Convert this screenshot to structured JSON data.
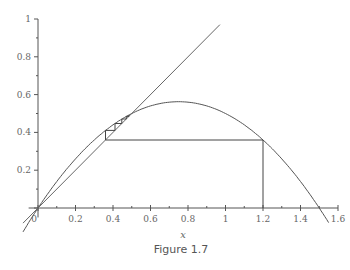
{
  "chart_data": {
    "type": "line",
    "title": "",
    "caption": "Figure 1.7",
    "xlabel": "x",
    "ylabel": "",
    "xlim": [
      0,
      1.6
    ],
    "ylim": [
      0,
      1
    ],
    "x_ticks": [
      0,
      0.2,
      0.4,
      0.6,
      0.8,
      1,
      1.2,
      1.4,
      1.6
    ],
    "x_tick_labels": [
      "0",
      "0.2",
      "0.4",
      "0.6",
      "0.8",
      "1",
      "1.2",
      "1.4",
      "1.6"
    ],
    "y_ticks": [
      0.2,
      0.4,
      0.6,
      0.8,
      1
    ],
    "y_tick_labels": [
      "0.2",
      "0.4",
      "0.6",
      "0.8",
      "1"
    ],
    "grid": false,
    "legend": null,
    "series": [
      {
        "name": "f(x) = 1.5x - x^2",
        "kind": "curve",
        "x": [
          -0.08,
          0,
          0.1,
          0.2,
          0.3,
          0.4,
          0.5,
          0.6,
          0.7,
          0.75,
          0.8,
          0.9,
          1.0,
          1.1,
          1.2,
          1.3,
          1.4,
          1.5,
          1.56
        ],
        "y": [
          -0.1264,
          0,
          0.14,
          0.26,
          0.36,
          0.44,
          0.5,
          0.54,
          0.56,
          0.5625,
          0.56,
          0.54,
          0.5,
          0.44,
          0.36,
          0.26,
          0.14,
          0,
          -0.0936
        ]
      },
      {
        "name": "y = x",
        "kind": "diagonal",
        "x": [
          -0.08,
          0.97
        ],
        "y": [
          -0.08,
          0.97
        ]
      },
      {
        "name": "cobweb",
        "kind": "cobweb",
        "x0": 1.2,
        "points": [
          [
            1.2,
            0
          ],
          [
            1.2,
            0.36
          ],
          [
            0.36,
            0.36
          ],
          [
            0.36,
            0.4104
          ],
          [
            0.4104,
            0.4104
          ],
          [
            0.4104,
            0.4472
          ],
          [
            0.4472,
            0.4472
          ],
          [
            0.4472,
            0.4708
          ],
          [
            0.4708,
            0.4708
          ],
          [
            0.4708,
            0.4846
          ],
          [
            0.4846,
            0.4846
          ],
          [
            0.4846,
            0.4921
          ]
        ]
      }
    ],
    "fixed_point": [
      0.5,
      0.5
    ]
  }
}
